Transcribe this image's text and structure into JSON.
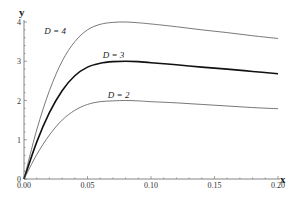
{
  "chart_data": {
    "type": "line",
    "title": "",
    "xlabel": "x",
    "ylabel": "y",
    "xlim": [
      0,
      0.2
    ],
    "ylim": [
      0,
      4
    ],
    "grid": false,
    "legend": "inline labels",
    "x_ticks": [
      "0.00",
      "0.05",
      "0.10",
      "0.15",
      "0.20"
    ],
    "y_ticks": [
      "0",
      "1",
      "2",
      "3",
      "4"
    ],
    "x": [
      0.0,
      0.01,
      0.02,
      0.03,
      0.04,
      0.05,
      0.06,
      0.07,
      0.08,
      0.09,
      0.1,
      0.12,
      0.14,
      0.16,
      0.18,
      0.2
    ],
    "series": [
      {
        "name": "D = 4",
        "label": "D = 4",
        "color": "#555555",
        "width": 0.8,
        "values": [
          0.0,
          1.25,
          2.25,
          3.0,
          3.5,
          3.8,
          3.94,
          3.99,
          4.0,
          3.98,
          3.95,
          3.88,
          3.8,
          3.73,
          3.65,
          3.58
        ]
      },
      {
        "name": "D = 3",
        "label": "D = 3",
        "color": "#111111",
        "width": 1.6,
        "values": [
          0.0,
          0.94,
          1.69,
          2.25,
          2.63,
          2.85,
          2.95,
          2.99,
          3.0,
          2.99,
          2.96,
          2.91,
          2.85,
          2.8,
          2.74,
          2.68
        ]
      },
      {
        "name": "D = 2",
        "label": "D = 2",
        "color": "#555555",
        "width": 0.8,
        "values": [
          0.0,
          0.62,
          1.12,
          1.5,
          1.75,
          1.9,
          1.97,
          1.99,
          2.0,
          1.99,
          1.97,
          1.94,
          1.9,
          1.86,
          1.82,
          1.79
        ]
      }
    ],
    "annotations": [
      {
        "text": "D = 4",
        "x": 0.016,
        "y": 3.7
      },
      {
        "text": "D = 3",
        "x": 0.062,
        "y": 3.08
      },
      {
        "text": "D = 2",
        "x": 0.066,
        "y": 2.07
      }
    ]
  }
}
